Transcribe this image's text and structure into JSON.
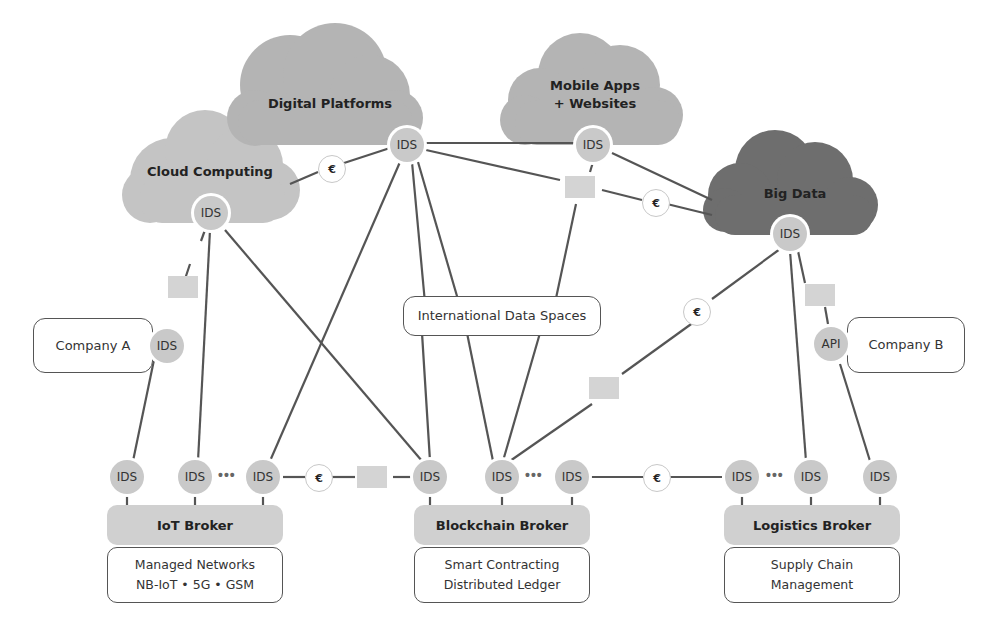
{
  "clouds": [
    {
      "id": "cloud-computing",
      "label": "Cloud Computing",
      "color": "#c4c4c4"
    },
    {
      "id": "digital-platforms",
      "label": "Digital Platforms",
      "color": "#b4b4b4"
    },
    {
      "id": "mobile-apps",
      "label_line1": "Mobile Apps",
      "label_line2": "+ Websites",
      "color": "#b4b4b4"
    },
    {
      "id": "big-data",
      "label": "Big Data",
      "color": "#6e6e6e"
    }
  ],
  "connector_label": "IDS",
  "api_label": "API",
  "euro_symbol": "€",
  "ellipsis": "•••",
  "center_label": "International Data Spaces",
  "companies": [
    {
      "label": "Company A",
      "connector": "IDS"
    },
    {
      "label": "Company B",
      "connector": "API"
    }
  ],
  "brokers": [
    {
      "label": "IoT Broker",
      "desc_line1": "Managed Networks",
      "desc_line2": "NB-IoT • 5G • GSM"
    },
    {
      "label": "Blockchain Broker",
      "desc_line1": "Smart Contracting",
      "desc_line2": "Distributed Ledger"
    },
    {
      "label": "Logistics Broker",
      "desc_line1": "Supply Chain",
      "desc_line2": "Management"
    }
  ],
  "colors": {
    "line": "#555555",
    "node": "#c9c9c9",
    "broker": "#d0d0d0",
    "packet": "#d4d4d4"
  }
}
